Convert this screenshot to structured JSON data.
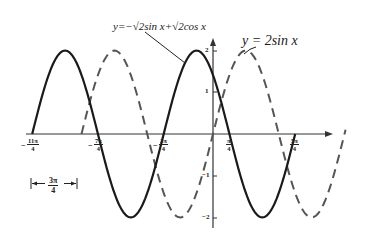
{
  "chart_data": {
    "type": "line",
    "title": "",
    "xlabel": "",
    "ylabel": "",
    "series": [
      {
        "name": "y=-√2sin x+√2cos x",
        "formula": "2cos(x+π/4)",
        "style": "solid",
        "color": "#1a1a1a",
        "x_range": [
          "-11π/4",
          "5π/4"
        ],
        "x": [
          -8.639,
          -7.069,
          -5.498,
          -3.927,
          -2.356,
          -0.785,
          0,
          0.785,
          2.356,
          3.927
        ],
        "values": [
          0,
          2,
          0,
          -2,
          0,
          2,
          1.414,
          0,
          -2,
          0
        ]
      },
      {
        "name": "y=2sin x",
        "formula": "2sin(x)",
        "style": "dashed",
        "color": "#555555",
        "x_range": [
          "-2π",
          "2π"
        ],
        "x": [
          -6.283,
          -4.712,
          -3.142,
          -1.571,
          0,
          1.571,
          3.142,
          4.712,
          6.283
        ],
        "values": [
          0,
          2,
          0,
          -2,
          0,
          2,
          0,
          -2,
          0
        ]
      }
    ],
    "x_tick_labels": [
      "-11π/4",
      "-7π/4",
      "-3π/4",
      "π/4",
      "5π/4"
    ],
    "x_ticks": [
      -8.639,
      -5.498,
      -2.356,
      0.785,
      3.927
    ],
    "y_tick_labels": [
      "2",
      "1",
      "-1",
      "-2"
    ],
    "y_ticks": [
      2,
      1,
      -1,
      -2
    ],
    "ylim": [
      -2,
      2
    ],
    "xlim": [
      -9.2,
      6.6
    ],
    "grid": false,
    "legend": "annotations",
    "annotations": [
      "y=-√2sin x+√2cos x",
      "y=2sin x",
      "|← 3π/4 →|"
    ]
  },
  "labels": {
    "eq_solid": "y=−√2sin x+√2cos x",
    "eq_dashed": "y = 2sin x",
    "period_num": "3π",
    "period_den": "4",
    "ticks": {
      "x0_num": "11π",
      "x0_den": "4",
      "x1_num": "7π",
      "x1_den": "4",
      "x2_num": "3π",
      "x2_den": "4",
      "x3_num": "π",
      "x3_den": "4",
      "x4_num": "5π",
      "x4_den": "4",
      "minus": "−",
      "y2": "2",
      "y1": "1",
      "ym1": "−1",
      "ym2": "−2"
    }
  }
}
